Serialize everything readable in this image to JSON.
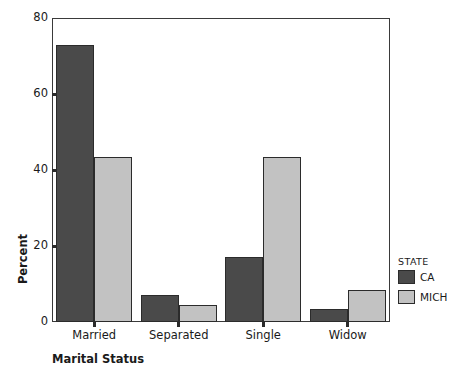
{
  "chart_data": {
    "type": "bar",
    "title": "",
    "xlabel": "Marital Status",
    "ylabel": "Percent",
    "categories": [
      "Married",
      "Separated",
      "Single",
      "Widow"
    ],
    "series": [
      {
        "name": "CA",
        "color": "#4a4a4a",
        "values": [
          73,
          7,
          17,
          3.5
        ]
      },
      {
        "name": "MICH",
        "color": "#c2c2c2",
        "values": [
          43.5,
          4.5,
          43.5,
          8.5
        ]
      }
    ],
    "ylim": [
      0,
      80
    ],
    "yticks": [
      0,
      20,
      40,
      60,
      80
    ],
    "ytick_labels": [
      "0",
      "20",
      "40",
      "60",
      "80"
    ],
    "grid": false,
    "legend": {
      "title": "STATE",
      "position": "right",
      "entries": [
        "CA",
        "MICH"
      ]
    }
  },
  "axis": {
    "y_title": "Percent",
    "x_title": "Marital Status"
  },
  "legend": {
    "title": "STATE",
    "entries": [
      {
        "label": "CA"
      },
      {
        "label": "MICH"
      }
    ]
  }
}
